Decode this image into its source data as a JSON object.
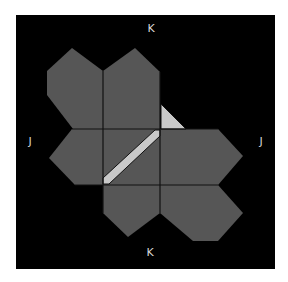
{
  "diagram": {
    "background": "#000000",
    "page_background": "#ffffff",
    "frame": {
      "x": 16,
      "y": 15,
      "width": 259,
      "height": 254
    },
    "colors": {
      "face_fill": "#565656",
      "highlight_fill": "#c9c9c9",
      "edge_stroke": "#111111",
      "label": "#d8d8d8"
    },
    "labels": [
      {
        "id": "top",
        "text": "K",
        "x": 151,
        "y": 29
      },
      {
        "id": "left",
        "text": "J",
        "x": 30,
        "y": 142
      },
      {
        "id": "right",
        "text": "J",
        "x": 261,
        "y": 142
      },
      {
        "id": "bottom",
        "text": "K",
        "x": 150,
        "y": 253
      }
    ],
    "faces": [
      {
        "id": "top-left",
        "points": "72,48 103,71 103,129 73,129 47,95 47,71"
      },
      {
        "id": "top-right",
        "points": "103,71 135,48 160,72 160,129 103,129"
      },
      {
        "id": "middle-left",
        "points": "72,129 103,129 103,185 75,185 49,158"
      },
      {
        "id": "middle-center",
        "points": "103,129 160,129 160,185 103,185"
      },
      {
        "id": "middle-right",
        "points": "160,129 218,129 243,156 218,185 160,185"
      },
      {
        "id": "bottom-left",
        "points": "103,185 160,185 160,213 128,237 103,213"
      },
      {
        "id": "bottom-right",
        "points": "160,185 218,185 243,213 218,241 193,241 160,213"
      }
    ],
    "highlights": [
      {
        "id": "corner-triangle",
        "points": "161,104 161,129 186,129"
      },
      {
        "id": "diagonal-strip",
        "points": "103,178 155,130 160,130 160,136 109,184 103,184"
      }
    ],
    "grid_lines": [
      {
        "x1": 103,
        "y1": 71,
        "x2": 103,
        "y2": 213
      },
      {
        "x1": 160,
        "y1": 72,
        "x2": 160,
        "y2": 213
      },
      {
        "x1": 72,
        "y1": 129,
        "x2": 218,
        "y2": 129
      },
      {
        "x1": 75,
        "y1": 185,
        "x2": 218,
        "y2": 185
      }
    ]
  }
}
